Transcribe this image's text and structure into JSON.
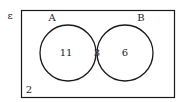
{
  "diagram": {
    "type": "venn",
    "universal_label": "ε",
    "sets": [
      {
        "name": "A",
        "label": "A"
      },
      {
        "name": "B",
        "label": "B"
      }
    ],
    "regions": {
      "only_a": "11",
      "a_and_b": "3",
      "only_b": "6",
      "outside": "2"
    },
    "colors": {
      "stroke": "#1a1a1a",
      "background": "#ffffff"
    }
  }
}
